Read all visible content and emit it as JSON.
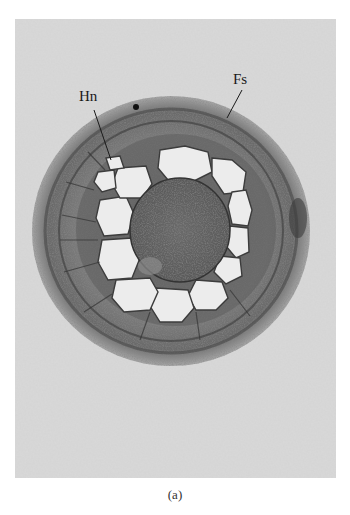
{
  "figure": {
    "caption": "(a)",
    "labels": {
      "hn": "Hn",
      "fs": "Fs"
    },
    "colors": {
      "background": "#d9d9d9",
      "tissue_dark": "#4a4a4a",
      "tissue_mid": "#8a8a8a",
      "cell_pale": "#ececec"
    }
  }
}
